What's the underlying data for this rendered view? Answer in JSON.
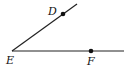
{
  "diagram": {
    "type": "angle",
    "name": "angle DEF",
    "stroke_color": "#222222",
    "vertex": {
      "label": "E",
      "x": 12,
      "y": 51,
      "label_x": 6,
      "label_y": 64
    },
    "rays": [
      {
        "name": "ray-ED",
        "x1": 12,
        "y1": 51,
        "x2": 77,
        "y2": 4
      },
      {
        "name": "ray-EF",
        "x1": 12,
        "y1": 51,
        "x2": 124,
        "y2": 51
      }
    ],
    "points": [
      {
        "label": "D",
        "x": 63,
        "y": 14,
        "label_x": 48,
        "label_y": 15
      },
      {
        "label": "F",
        "x": 91,
        "y": 51,
        "label_x": 87,
        "label_y": 65
      }
    ]
  }
}
